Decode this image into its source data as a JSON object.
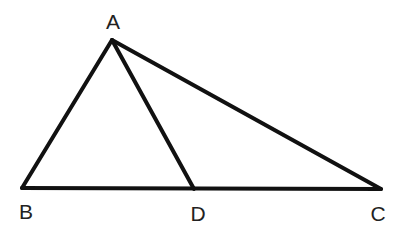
{
  "diagram": {
    "type": "geometry-triangle",
    "points": {
      "A": {
        "label": "A",
        "x": 112,
        "y": 40,
        "label_x": 113,
        "label_y": 29
      },
      "B": {
        "label": "B",
        "x": 22,
        "y": 188,
        "label_x": 26,
        "label_y": 219
      },
      "D": {
        "label": "D",
        "x": 194,
        "y": 189,
        "label_x": 198,
        "label_y": 221
      },
      "C": {
        "label": "C",
        "x": 381,
        "y": 189,
        "label_x": 378,
        "label_y": 221
      }
    },
    "segments": [
      "AB",
      "AC",
      "BC",
      "AD"
    ],
    "stroke_color": "#111111",
    "label_color": "#222222"
  }
}
